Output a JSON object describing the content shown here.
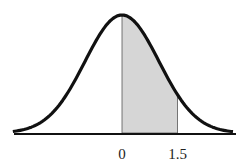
{
  "chart_data": {
    "type": "area",
    "title": "",
    "distribution": "normal",
    "mean": 0,
    "sd": 1,
    "shaded_region": {
      "from": 0,
      "to": 1.5
    },
    "tick_labels": [
      "0",
      "1.5"
    ],
    "tick_values": [
      0,
      1.5
    ],
    "xlabel": "",
    "ylabel": "",
    "xlim": [
      -3,
      3
    ],
    "grid": false,
    "colors": {
      "curve": "#111111",
      "shade": "#d4d4d4",
      "axis": "#111111"
    }
  }
}
